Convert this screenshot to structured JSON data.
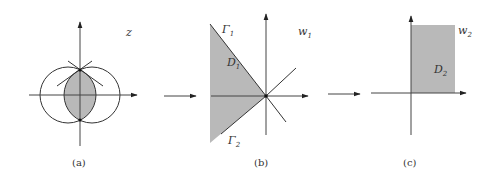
{
  "figure": {
    "panels": [
      {
        "id": "a",
        "caption": "(a)",
        "plane_label": "z",
        "description": "Two overlapping circles symmetric about the imaginary axis; lens-shaped intersection shaded; tangent lines at upper intersection point"
      },
      {
        "id": "b",
        "caption": "(b)",
        "plane_label": "w",
        "plane_subscript": "1",
        "region_label": "D",
        "region_subscript": "1",
        "boundary_labels": [
          {
            "name": "Γ",
            "subscript": "1"
          },
          {
            "name": "Γ",
            "subscript": "2"
          }
        ],
        "description": "Wedge region D1 bounded by rays Γ1 and Γ2 meeting at origin, shaded"
      },
      {
        "id": "c",
        "caption": "(c)",
        "plane_label": "w",
        "plane_subscript": "2",
        "region_label": "D",
        "region_subscript": "2",
        "description": "First-quadrant shaded region D2"
      }
    ],
    "arrows": [
      "a-to-b",
      "b-to-c"
    ],
    "colors": {
      "shade": "#b9b9b9",
      "line": "#333333"
    }
  }
}
